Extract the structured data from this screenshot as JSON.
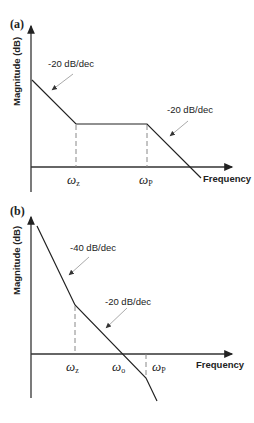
{
  "panels": {
    "a": {
      "label": "(a)",
      "y_axis_label": "Magnitude (dB)",
      "x_axis_label": "Frequency",
      "slopes": [
        "-20 dB/dec",
        "-20 dB/dec"
      ],
      "breakpoints": [
        {
          "symbol": "ω",
          "sub": "z"
        },
        {
          "symbol": "ω",
          "sub": "P"
        }
      ]
    },
    "b": {
      "label": "(b)",
      "y_axis_label": "Magnitude (dB)",
      "x_axis_label": "Frequency",
      "slopes": [
        "-40 dB/dec",
        "-20 dB/dec"
      ],
      "breakpoints": [
        {
          "symbol": "ω",
          "sub": "z"
        },
        {
          "symbol": "ω",
          "sub": "o"
        },
        {
          "symbol": "ω",
          "sub": "P"
        }
      ]
    }
  },
  "colors": {
    "line": "#222222",
    "dashed": "#888888",
    "pointer": "#aaaaaa"
  }
}
